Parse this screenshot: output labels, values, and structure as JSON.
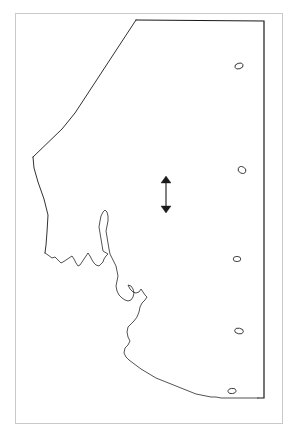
{
  "figure": {
    "type": "map-outline",
    "title": "",
    "background_color": "#ffffff",
    "frame_color": "#c9c9c9",
    "outline_color": "#1a1a1a",
    "frame": {
      "x": 15,
      "y": 13,
      "width": 268,
      "height": 411
    }
  },
  "map": {
    "region_name": "",
    "boundary_style": "political-and-coastline",
    "stroke_color": "#1a1a1a",
    "stroke_width_border": 1.1,
    "stroke_width_coast": 0.7,
    "fill": "none",
    "border_path": "M 136 20 L 264 21 L 264 398 L 258 398",
    "northwest_path": "M 136 20 L 75 113 L 62 129 L 33 157",
    "west_path": "M 33 157 L 34 168 L 38 182 L 44 199 L 48 215 L 47 232 L 46 245 L 45 253",
    "coastline_path": "M 45 253 L 48 255 L 52 258 L 55 257 L 58 260 L 61 263 L 63 262 L 66 260 L 69 258 L 72 256 L 74 259 L 76 263 L 78 266 L 80 265 L 82 262 L 84 259 L 86 256 L 88 253 L 90 256 L 92 260 L 94 263 L 96 265 L 99 266 L 101 264 L 103 262 L 104 259 L 106 256 L 108 254 L 103 251 L 102 245 L 101 239 L 100 233 L 99 227 L 100 221 L 101 216 L 103 212 L 105 210 L 107 212 L 108 216 L 108 221 L 107 226 L 106 231 L 107 237 L 108 243 L 109 249 L 110 254 L 112 258 L 114 262 L 116 266 L 117 271 L 118 276 L 117 281 L 116 286 L 117 291 L 119 295 L 122 298 L 125 300 L 128 301 L 131 300 L 133 297 L 134 293 L 133 289 L 131 286 L 128 285 L 130 289 L 133 292 L 136 293 L 139 292 L 141 289 L 143 292 L 145 295 L 147 297 L 145 300 L 142 303 L 140 307 L 139 312 L 137 317 L 134 321 L 131 324 L 128 327 L 127 332 L 128 337 L 130 341 L 128 345 L 125 348 L 124 353 L 126 357 L 129 360 L 133 363 L 137 366 L 141 369 L 146 372 L 151 375 L 156 378 L 161 380 L 166 382 L 171 384 L 176 386 L 181 388 L 186 390 L 191 392 L 196 394 L 201 395 L 206 396 L 211 397 L 216 397 L 221 398 L 226 398 L 231 398 L 236 398 L 241 398 L 246 398 L 251 398 L 258 398",
    "islands": [
      {
        "name": "island-1",
        "cx": 239,
        "cy": 66,
        "rx": 4.2,
        "ry": 2.8,
        "rotation": -18
      },
      {
        "name": "island-2",
        "cx": 242,
        "cy": 170,
        "rx": 4.0,
        "ry": 3.2,
        "rotation": 25
      },
      {
        "name": "island-3",
        "cx": 237,
        "cy": 259,
        "rx": 3.8,
        "ry": 2.6,
        "rotation": 0
      },
      {
        "name": "island-4",
        "cx": 239,
        "cy": 331,
        "rx": 4.4,
        "ry": 2.8,
        "rotation": 10
      },
      {
        "name": "island-5",
        "cx": 232,
        "cy": 391,
        "rx": 4.0,
        "ry": 2.6,
        "rotation": -8
      }
    ]
  },
  "annotations": {
    "scale_arrow": {
      "label": "",
      "type": "double-headed-vertical-arrow",
      "color": "#1a1a1a",
      "x": 166,
      "y_top": 176,
      "y_bottom": 213,
      "head_width": 5,
      "head_length": 7
    }
  }
}
